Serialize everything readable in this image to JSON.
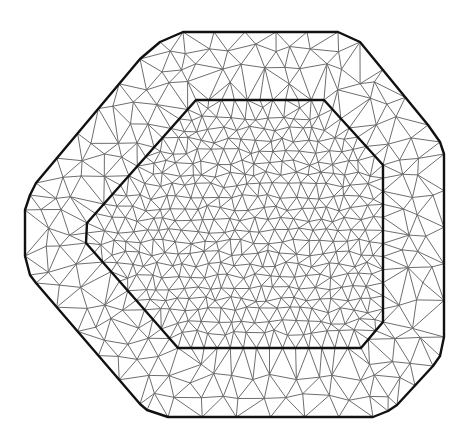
{
  "diagram": {
    "type": "triangular-mesh",
    "colors": {
      "background": "#ffffff",
      "mesh_edge": "#6e6e6e",
      "boundary": "#111111"
    },
    "outer_boundary": [
      [
        183,
        32
      ],
      [
        338,
        32
      ],
      [
        360,
        42
      ],
      [
        428,
        125
      ],
      [
        440,
        142
      ],
      [
        444,
        154
      ],
      [
        444,
        337
      ],
      [
        440,
        356
      ],
      [
        433,
        366
      ],
      [
        397,
        405
      ],
      [
        388,
        411
      ],
      [
        373,
        417
      ],
      [
        168,
        417
      ],
      [
        147,
        410
      ],
      [
        140,
        404
      ],
      [
        36,
        283
      ],
      [
        30,
        275
      ],
      [
        25,
        256
      ],
      [
        25,
        210
      ],
      [
        30,
        195
      ],
      [
        36,
        183
      ],
      [
        140,
        59
      ],
      [
        160,
        42
      ]
    ],
    "inner_boundary": [
      [
        196,
        100
      ],
      [
        324,
        100
      ],
      [
        383,
        165
      ],
      [
        383,
        322
      ],
      [
        361,
        348
      ],
      [
        178,
        348
      ],
      [
        86,
        243
      ],
      [
        87,
        223
      ]
    ],
    "mesh": {
      "inner_spacing": 13,
      "outer_spacing": 34,
      "seed": 7
    }
  }
}
